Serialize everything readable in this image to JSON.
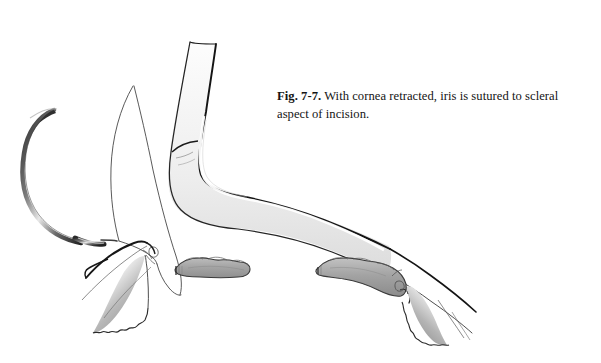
{
  "figure": {
    "label": "Fig. 7-7.",
    "caption": "With cornea retracted, iris is sutured to scleral aspect of incision.",
    "background_color": "#ffffff",
    "ink_color": "#1a1a1a",
    "shade_color": "#999999",
    "light_shade_color": "#cccccc"
  },
  "illustration": {
    "title": "Ophthalmic surgical illustration of iris suturing to scleral aspect of incision",
    "elements": [
      {
        "id": "curved-needle",
        "label": "curved surgical needle",
        "position": "left"
      },
      {
        "id": "suture-thread",
        "label": "suture thread",
        "position": "left-center"
      },
      {
        "id": "retracted-cornea",
        "label": "retracted cornea flap",
        "position": "center-right"
      },
      {
        "id": "iris-tissue",
        "label": "iris tissue",
        "position": "center"
      },
      {
        "id": "scleral-wedge-left",
        "label": "scleral aspect of incision, left",
        "position": "bottom-left"
      },
      {
        "id": "scleral-wedge-right",
        "label": "scleral aspect of incision, right",
        "position": "bottom-right"
      }
    ]
  }
}
